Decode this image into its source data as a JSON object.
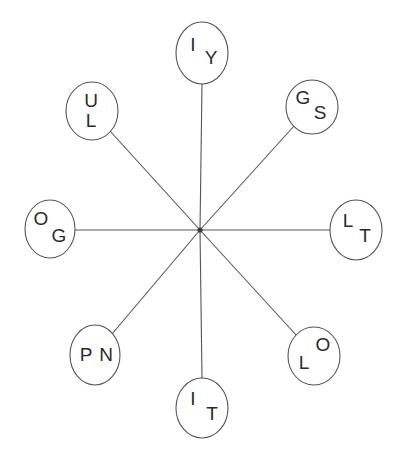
{
  "diagram": {
    "type": "radial-star-graph",
    "background_color": "#ffffff",
    "line_color": "#555555",
    "text_color": "#2b2b2b",
    "center": {
      "x": 200,
      "y": 230,
      "label": ""
    },
    "node_count": 8,
    "nodes": [
      {
        "id": "node-top",
        "position": "top",
        "cx": 202,
        "cy": 53,
        "rx": 26,
        "ry": 31,
        "letters": [
          {
            "text": "I",
            "x": 193,
            "y": 46
          },
          {
            "text": "Y",
            "x": 211,
            "y": 59
          }
        ]
      },
      {
        "id": "node-top-right",
        "position": "top-right",
        "cx": 312,
        "cy": 107,
        "rx": 26,
        "ry": 27,
        "letters": [
          {
            "text": "G",
            "x": 303,
            "y": 99
          },
          {
            "text": "S",
            "x": 320,
            "y": 114
          }
        ]
      },
      {
        "id": "node-right",
        "position": "right",
        "cx": 356,
        "cy": 230,
        "rx": 26,
        "ry": 30,
        "letters": [
          {
            "text": "L",
            "x": 348,
            "y": 222
          },
          {
            "text": "T",
            "x": 365,
            "y": 237
          }
        ]
      },
      {
        "id": "node-bottom-right",
        "position": "bottom-right",
        "cx": 314,
        "cy": 356,
        "rx": 26,
        "ry": 29,
        "letters": [
          {
            "text": "O",
            "x": 323,
            "y": 346
          },
          {
            "text": "L",
            "x": 304,
            "y": 364
          }
        ]
      },
      {
        "id": "node-bottom",
        "position": "bottom",
        "cx": 202,
        "cy": 408,
        "rx": 26,
        "ry": 30,
        "letters": [
          {
            "text": "I",
            "x": 193,
            "y": 400
          },
          {
            "text": "T",
            "x": 212,
            "y": 415
          }
        ]
      },
      {
        "id": "node-bottom-left",
        "position": "bottom-left",
        "cx": 95,
        "cy": 355,
        "rx": 25,
        "ry": 30,
        "letters": [
          {
            "text": "P",
            "x": 86,
            "y": 356
          },
          {
            "text": "N",
            "x": 106,
            "y": 356
          }
        ]
      },
      {
        "id": "node-left",
        "position": "left",
        "cx": 50,
        "cy": 229,
        "rx": 25,
        "ry": 29,
        "letters": [
          {
            "text": "O",
            "x": 41,
            "y": 220
          },
          {
            "text": "G",
            "x": 59,
            "y": 237
          }
        ]
      },
      {
        "id": "node-top-left",
        "position": "top-left",
        "cx": 92,
        "cy": 111,
        "rx": 26,
        "ry": 29,
        "letters": [
          {
            "text": "U",
            "x": 91,
            "y": 102
          },
          {
            "text": "L",
            "x": 91,
            "y": 122
          }
        ]
      }
    ],
    "edges": [
      {
        "id": "edge-top",
        "x1": 200,
        "y1": 230,
        "x2": 202,
        "y2": 84
      },
      {
        "id": "edge-top-right",
        "x1": 200,
        "y1": 230,
        "x2": 294,
        "y2": 126
      },
      {
        "id": "edge-right",
        "x1": 200,
        "y1": 230,
        "x2": 330,
        "y2": 230
      },
      {
        "id": "edge-bottom-right",
        "x1": 200,
        "y1": 230,
        "x2": 297,
        "y2": 336
      },
      {
        "id": "edge-bottom",
        "x1": 200,
        "y1": 230,
        "x2": 202,
        "y2": 378
      },
      {
        "id": "edge-bottom-left",
        "x1": 200,
        "y1": 230,
        "x2": 112,
        "y2": 334
      },
      {
        "id": "edge-left",
        "x1": 200,
        "y1": 230,
        "x2": 75,
        "y2": 230
      },
      {
        "id": "edge-top-left",
        "x1": 200,
        "y1": 230,
        "x2": 110,
        "y2": 131
      }
    ]
  }
}
